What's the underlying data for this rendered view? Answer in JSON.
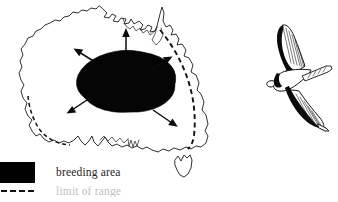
{
  "figure": {
    "background_color": "#ffffff",
    "ink_color": "#111111"
  },
  "map": {
    "name": "Australia",
    "breeding_area": {
      "label": "breeding area",
      "fill_color": "#000000",
      "shape": "ellipse",
      "description": "solid black ellipse covering the arid interior of the continent"
    },
    "range_limit": {
      "style": "dashed",
      "description": "dashed line tracing the eastern and south-western coastal range limit"
    },
    "islands": [
      {
        "name": "Tasmania"
      }
    ],
    "dispersal_arrows": [
      {
        "direction": "north",
        "description": "arrow pointing north toward Cape York"
      },
      {
        "direction": "north-west",
        "description": "arrow pointing north-west toward the Kimberley"
      },
      {
        "direction": "south-west",
        "description": "arrow pointing south-west toward the Nullarbor coast"
      },
      {
        "direction": "north-east",
        "description": "arrow pointing north-east toward Queensland coast"
      },
      {
        "direction": "south-east",
        "description": "arrow pointing south-east toward New South Wales coast"
      }
    ]
  },
  "bird": {
    "name": "bird-in-flight",
    "description": "line drawing of a long-winged bird in flight seen from below, with dark leading-edge wing markings and a forked tail"
  },
  "legend": {
    "items": [
      {
        "symbol": "black-swatch",
        "label": "breeding area",
        "color": "#000000",
        "clipped": false
      },
      {
        "symbol": "dashed-line",
        "label": "limit of range",
        "color": "#111111",
        "clipped": true
      }
    ]
  }
}
